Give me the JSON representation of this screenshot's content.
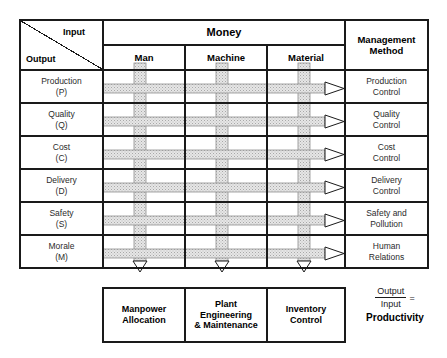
{
  "diagram": {
    "corner": {
      "input_label": "Input",
      "output_label": "Output",
      "divider": "diagonal-line"
    },
    "input_group_header": "Money",
    "input_columns": [
      {
        "id": "man",
        "label": "Man"
      },
      {
        "id": "machine",
        "label": "Machine"
      },
      {
        "id": "material",
        "label": "Material"
      }
    ],
    "management_header_line1": "Management",
    "management_header_line2": "Method",
    "rows": [
      {
        "id": "production",
        "output_line1": "Production",
        "output_line2": "(P)",
        "method_line1": "Production",
        "method_line2": "Control"
      },
      {
        "id": "quality",
        "output_line1": "Quality",
        "output_line2": "(Q)",
        "method_line1": "Quality",
        "method_line2": "Control"
      },
      {
        "id": "cost",
        "output_line1": "Cost",
        "output_line2": "(C)",
        "method_line1": "Cost",
        "method_line2": "Control"
      },
      {
        "id": "delivery",
        "output_line1": "Delivery",
        "output_line2": "(D)",
        "method_line1": "Delivery",
        "method_line2": "Control"
      },
      {
        "id": "safety",
        "output_line1": "Safety",
        "output_line2": "(S)",
        "method_line1": "Safety and",
        "method_line2": "Pollution"
      },
      {
        "id": "morale",
        "output_line1": "Morale",
        "output_line2": "(M)",
        "method_line1": "Human",
        "method_line2": "Relations"
      }
    ],
    "footer_boxes": [
      {
        "id": "manpower",
        "line1": "Manpower",
        "line2": "Allocation",
        "line3": ""
      },
      {
        "id": "plant",
        "line1": "Plant",
        "line2": "Engineering",
        "line3": "& Maintenance"
      },
      {
        "id": "inventory",
        "line1": "Inventory",
        "line2": "Control",
        "line3": ""
      }
    ],
    "formula": {
      "numerator": "Output",
      "denominator": "Input",
      "equals": "=",
      "result": "Productivity"
    },
    "arrows": {
      "horizontal_count": 6,
      "horizontal_direction": "right",
      "horizontal_style": "hatched-band-with-open-triangle-head",
      "vertical_count": 3,
      "vertical_direction": "down",
      "vertical_style": "hatched-band-with-open-triangle-head"
    },
    "colors": {
      "stroke": "#1a1a1a",
      "band_fill": "#e3e3e3",
      "band_edge": "#8a8a8a",
      "text": "#2b2b2b",
      "background": "#ffffff"
    }
  }
}
